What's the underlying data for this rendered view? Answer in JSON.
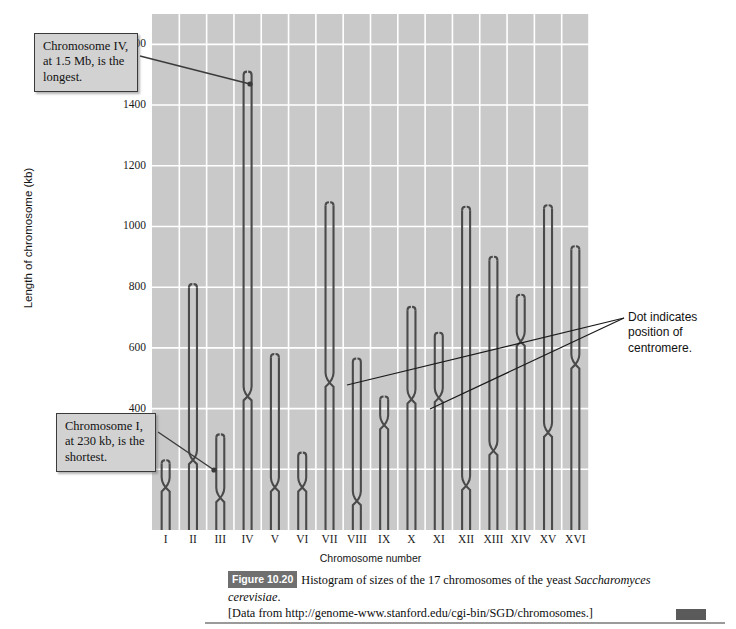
{
  "axes": {
    "ylabel": "Length of chromosome (kb)",
    "xlabel": "Chromosome number",
    "yticks": [
      200,
      400,
      600,
      800,
      1000,
      1200,
      1400,
      1600
    ]
  },
  "annotations": {
    "longest": "Chromosome IV, at 1.5 Mb, is the longest.",
    "shortest": "Chromosome I, at 230 kb, is the shortest.",
    "centromere": "Dot indicates position of centromere."
  },
  "caption": {
    "figure_number": "Figure 10.20",
    "text_before_italic": "Histogram of sizes of the 17 chromosomes of the yeast ",
    "italic_species": "Saccharomyces cerevisiae",
    "text_after_italic": ".",
    "source": "[Data from http://genome-www.stanford.edu/cgi-bin/SGD/chromosomes.]"
  },
  "colors": {
    "plot_background": "#c9c9c9",
    "gridline": "#ffffff",
    "chromosome": "#4a4a4a",
    "callout_background": "#d2d2d2",
    "callout_border": "#3a3a3a",
    "badge": "#6f6f6f"
  },
  "chart_data": {
    "type": "bar",
    "title": "Histogram of sizes of the 17 chromosomes of the yeast Saccharomyces cerevisiae",
    "xlabel": "Chromosome number",
    "ylabel": "Length of chromosome (kb)",
    "ylim": [
      0,
      1700
    ],
    "grid": true,
    "legend": null,
    "note": "Each bar is drawn as two parallel sister-chromatid lines that cross at the centromere; the crossing X marks the centromere position.",
    "categories": [
      "I",
      "II",
      "III",
      "IV",
      "V",
      "VI",
      "VII",
      "VIII",
      "IX",
      "X",
      "XI",
      "XII",
      "XIII",
      "XIV",
      "XV",
      "XVI"
    ],
    "values": [
      230,
      810,
      315,
      1510,
      580,
      255,
      1080,
      565,
      440,
      735,
      650,
      1065,
      900,
      775,
      1070,
      935
    ],
    "centromere_kb": [
      150,
      240,
      115,
      450,
      150,
      150,
      495,
      105,
      355,
      440,
      445,
      155,
      270,
      630,
      330,
      555
    ]
  }
}
